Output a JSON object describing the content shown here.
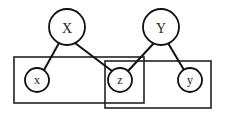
{
  "diagram": {
    "type": "graphical-model",
    "nodes": [
      {
        "id": "X",
        "label": "X",
        "cx": 67,
        "cy": 27,
        "r": 18,
        "size": "big"
      },
      {
        "id": "Y",
        "label": "Y",
        "cx": 161,
        "cy": 27,
        "r": 18,
        "size": "big"
      },
      {
        "id": "x",
        "label": "x",
        "cx": 37,
        "cy": 80,
        "r": 12,
        "size": "small"
      },
      {
        "id": "z",
        "label": "z",
        "cx": 120,
        "cy": 80,
        "r": 12,
        "size": "small"
      },
      {
        "id": "y",
        "label": "y",
        "cx": 190,
        "cy": 80,
        "r": 12,
        "size": "small"
      }
    ],
    "edges": [
      {
        "from": "X",
        "to": "x"
      },
      {
        "from": "X",
        "to": "z"
      },
      {
        "from": "Y",
        "to": "z"
      },
      {
        "from": "Y",
        "to": "y"
      }
    ],
    "plates": [
      {
        "id": "plate-left",
        "contains": [
          "x",
          "z"
        ],
        "x": 14,
        "y": 57,
        "w": 130,
        "h": 46
      },
      {
        "id": "plate-right",
        "contains": [
          "z",
          "y"
        ],
        "x": 105,
        "y": 61,
        "w": 106,
        "h": 47
      }
    ]
  }
}
